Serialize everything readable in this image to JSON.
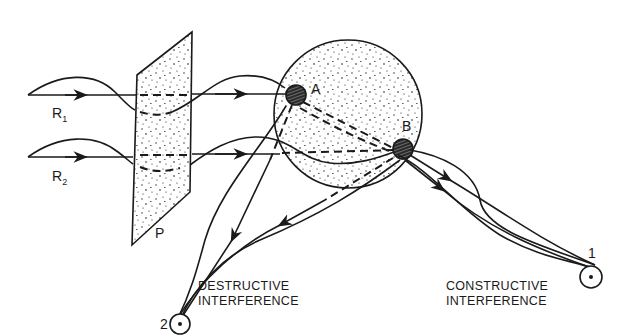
{
  "diagram": {
    "rays": [
      {
        "id": "R1",
        "label": "R",
        "subscript": "1"
      },
      {
        "id": "R2",
        "label": "R",
        "subscript": "2"
      }
    ],
    "plane_label": "P",
    "scatterers": [
      {
        "id": "A",
        "label": "A"
      },
      {
        "id": "B",
        "label": "B"
      }
    ],
    "detectors": [
      {
        "id": "1",
        "label": "1",
        "caption_line1": "CONSTRUCTIVE",
        "caption_line2": "INTERFERENCE"
      },
      {
        "id": "2",
        "label": "2",
        "caption_line1": "DESTRUCTIVE",
        "caption_line2": "INTERFERENCE"
      }
    ],
    "colors": {
      "ink": "#1a1a1a",
      "background": "#ffffff"
    }
  }
}
